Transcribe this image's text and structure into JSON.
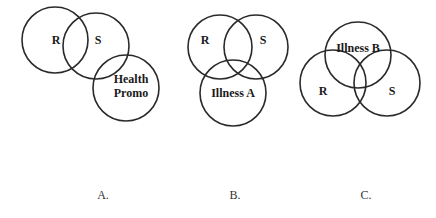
{
  "diagrams": [
    {
      "caption": "A.",
      "circles": [
        {
          "label": "R",
          "cx": 55,
          "cy": 40,
          "r": 33,
          "lx": 55,
          "ly": 44
        },
        {
          "label": "S",
          "cx": 96,
          "cy": 46,
          "r": 33,
          "lx": 98,
          "ly": 44
        },
        {
          "label_lines": [
            "Health",
            "Promo"
          ],
          "cx": 126,
          "cy": 88,
          "r": 33,
          "lx": 131,
          "ly": 84
        }
      ]
    },
    {
      "caption": "B.",
      "circles": [
        {
          "label": "R",
          "cx": 220,
          "cy": 47,
          "r": 32,
          "lx": 205,
          "ly": 43
        },
        {
          "label": "S",
          "cx": 256,
          "cy": 47,
          "r": 32,
          "lx": 262,
          "ly": 43
        },
        {
          "label": "Illness A",
          "cx": 233,
          "cy": 93,
          "r": 33,
          "lx": 232,
          "ly": 97
        }
      ]
    },
    {
      "caption": "C.",
      "circles": [
        {
          "label": "Illness B",
          "cx": 357,
          "cy": 55,
          "r": 33,
          "lx": 357,
          "ly": 52
        },
        {
          "label": "R",
          "cx": 333,
          "cy": 82,
          "r": 33,
          "lx": 323,
          "ly": 95
        },
        {
          "label": "S",
          "cx": 387,
          "cy": 82,
          "r": 33,
          "lx": 392,
          "ly": 95
        }
      ]
    }
  ],
  "captions": {
    "a": "A.",
    "b": "B.",
    "c": "C."
  },
  "text": {
    "a_r": "R",
    "a_s": "S",
    "a_hp1": "Health",
    "a_hp2": "Promo",
    "b_r": "R",
    "b_s": "S",
    "b_ill": "Illness A",
    "c_ill": "Illness B",
    "c_r": "R",
    "c_s": "S"
  },
  "colors": {
    "stroke": "#2a2a2a",
    "text": "#1a1a1a",
    "background": "#ffffff"
  }
}
